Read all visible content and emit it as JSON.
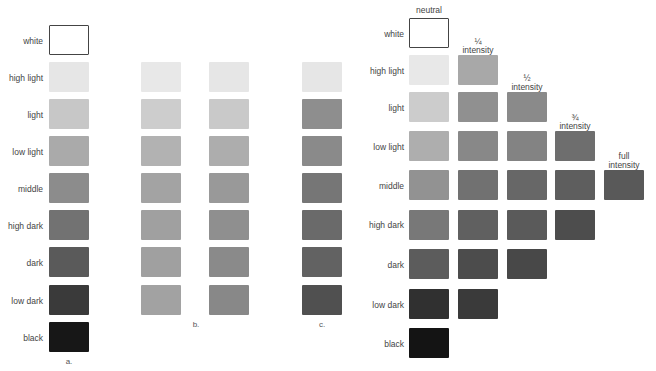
{
  "panel_a": {
    "caption": "a.",
    "rows": [
      {
        "label": "white",
        "color": "#ffffff"
      },
      {
        "label": "high light",
        "color": "#e6e6e6"
      },
      {
        "label": "light",
        "color": "#c7c7c7"
      },
      {
        "label": "low light",
        "color": "#aaaaaa"
      },
      {
        "label": "middle",
        "color": "#8c8c8c"
      },
      {
        "label": "high dark",
        "color": "#727272"
      },
      {
        "label": "dark",
        "color": "#5a5a5a"
      },
      {
        "label": "low dark",
        "color": "#3a3a3a"
      },
      {
        "label": "black",
        "color": "#171717"
      }
    ]
  },
  "panel_b": {
    "caption": "b.",
    "columns": [
      {
        "colors": [
          "#e8e8e8",
          "#cdcdcd",
          "#b2b2b2",
          "#a3a3a3",
          "#a0a0a0",
          "#a0a0a0",
          "#a2a2a2",
          "#a0a0a0"
        ]
      },
      {
        "colors": [
          "#e6e6e6",
          "#c9c9c9",
          "#adadad",
          "#999999",
          "#8f8f8f",
          "#8a8a8a",
          "#888888",
          "#777777"
        ]
      }
    ]
  },
  "panel_c": {
    "caption": "c.",
    "colors": [
      "#e6e6e6",
      "#8e8e8e",
      "#8a8a8a",
      "#767676",
      "#6a6a6a",
      "#626262",
      "#505050",
      "#1e1e1e"
    ]
  },
  "panel_right": {
    "column_headers": [
      {
        "line1": "neutral",
        "line2": ""
      },
      {
        "line1": "¼",
        "line2": "intensity"
      },
      {
        "line1": "½",
        "line2": "intensity"
      },
      {
        "line1": "¾",
        "line2": "intensity"
      },
      {
        "line1": "full",
        "line2": "intensity"
      }
    ],
    "rows": [
      {
        "label": "white",
        "colors": [
          "#ffffff"
        ]
      },
      {
        "label": "high light",
        "colors": [
          "#e8e8e8",
          "#a8a8a8"
        ]
      },
      {
        "label": "light",
        "colors": [
          "#cccccc",
          "#909090",
          "#8a8a8a"
        ]
      },
      {
        "label": "low light",
        "colors": [
          "#aeaeae",
          "#888888",
          "#838383",
          "#6e6e6e"
        ]
      },
      {
        "label": "middle",
        "colors": [
          "#929292",
          "#717171",
          "#676767",
          "#5e5e5e",
          "#595959"
        ]
      },
      {
        "label": "high dark",
        "colors": [
          "#787878",
          "#606060",
          "#5a5a5a",
          "#4d4d4d"
        ]
      },
      {
        "label": "dark",
        "colors": [
          "#5c5c5c",
          "#4c4c4c",
          "#484848"
        ]
      },
      {
        "label": "low dark",
        "colors": [
          "#303030",
          "#3a3a3a"
        ]
      },
      {
        "label": "black",
        "colors": [
          "#141414"
        ]
      }
    ]
  }
}
